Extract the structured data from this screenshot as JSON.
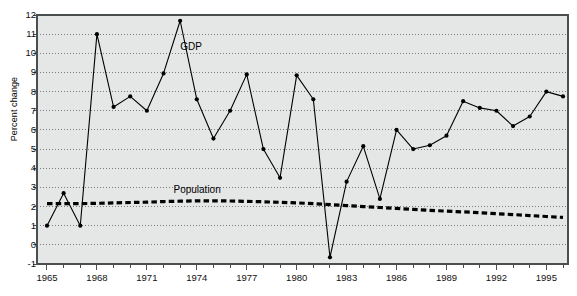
{
  "chart_data": {
    "type": "line",
    "title": "",
    "xlabel": "",
    "ylabel": "Percent change",
    "xlim": [
      1964.4,
      1996.3
    ],
    "ylim": [
      -1,
      12
    ],
    "grid": true,
    "grid_style": "dotted-horizontal",
    "legend": "inline-annotations",
    "xtick_labels": [
      "1965",
      "1968",
      "1971",
      "1974",
      "1977",
      "1980",
      "1983",
      "1986",
      "1989",
      "1992",
      "1995"
    ],
    "xtick_values": [
      1965,
      1968,
      1971,
      1974,
      1977,
      1980,
      1983,
      1986,
      1989,
      1992,
      1995
    ],
    "xtick_minor_step": 1,
    "ytick_labels": [
      "-1",
      "0",
      "1",
      "2",
      "3",
      "4",
      "5",
      "6",
      "7",
      "8",
      "9",
      "10",
      "11",
      "12"
    ],
    "ytick_values": [
      -1,
      0,
      1,
      2,
      3,
      4,
      5,
      6,
      7,
      8,
      9,
      10,
      11,
      12
    ],
    "x": [
      1965,
      1966,
      1967,
      1968,
      1969,
      1970,
      1971,
      1972,
      1973,
      1974,
      1975,
      1976,
      1977,
      1978,
      1979,
      1980,
      1981,
      1982,
      1983,
      1984,
      1985,
      1986,
      1987,
      1988,
      1989,
      1990,
      1991,
      1992,
      1993,
      1994,
      1995,
      1996
    ],
    "series": [
      {
        "name": "GDP",
        "style": "solid-with-markers",
        "color": "#000000",
        "label_x": 1973.0,
        "label_y": 10.35,
        "values": [
          1.0,
          2.7,
          1.0,
          11.0,
          7.2,
          7.75,
          7.0,
          8.95,
          11.7,
          7.6,
          5.55,
          7.0,
          8.9,
          5.0,
          3.5,
          8.85,
          7.6,
          -0.65,
          3.3,
          5.15,
          2.4,
          6.0,
          5.0,
          5.2,
          5.7,
          7.5,
          7.15,
          7.0,
          6.2,
          6.7,
          8.0,
          7.75
        ]
      },
      {
        "name": "Population",
        "style": "thick-dashed",
        "color": "#000000",
        "label_x": 1972.6,
        "label_y": 2.85,
        "values": [
          2.15,
          2.15,
          2.15,
          2.17,
          2.19,
          2.21,
          2.23,
          2.26,
          2.28,
          2.3,
          2.3,
          2.29,
          2.27,
          2.25,
          2.22,
          2.19,
          2.15,
          2.1,
          2.05,
          2.0,
          1.95,
          1.9,
          1.85,
          1.8,
          1.76,
          1.72,
          1.68,
          1.63,
          1.58,
          1.53,
          1.48,
          1.43
        ]
      }
    ]
  },
  "style": {
    "plot_background": "#e5e7e7",
    "page_background": "#ffffff",
    "gridline_color": "#6f7374",
    "axis_color": "#4a4e4f",
    "text_color": "#111111"
  }
}
